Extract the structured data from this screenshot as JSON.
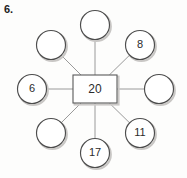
{
  "worksheet": {
    "question_number": "6."
  },
  "diagram": {
    "type": "number-web",
    "center": {
      "label": "20",
      "shape": "rectangle",
      "cx": 95,
      "cy": 89,
      "width": 44,
      "height": 28
    },
    "node_radius": 14.5,
    "spoke_color": "#9a9a9a",
    "node_stroke_color": "#4d4d4d",
    "center_stroke_color": "#5a5a5a",
    "background_color": "#fdfdfc",
    "nodes": [
      {
        "id": "node-top",
        "label": "",
        "cx": 95,
        "cy": 25,
        "position": "top"
      },
      {
        "id": "node-top-right",
        "label": "8",
        "cx": 140,
        "cy": 45,
        "position": "top-right"
      },
      {
        "id": "node-right",
        "label": "",
        "cx": 159,
        "cy": 89,
        "position": "right"
      },
      {
        "id": "node-bottom-right",
        "label": "11",
        "cx": 140,
        "cy": 133,
        "position": "bottom-right"
      },
      {
        "id": "node-bottom",
        "label": "17",
        "cx": 95,
        "cy": 153,
        "position": "bottom"
      },
      {
        "id": "node-bottom-left",
        "label": "",
        "cx": 51,
        "cy": 133,
        "position": "bottom-left"
      },
      {
        "id": "node-left",
        "label": "6",
        "cx": 32,
        "cy": 89,
        "position": "left"
      },
      {
        "id": "node-top-left",
        "label": "",
        "cx": 51,
        "cy": 45,
        "position": "top-left"
      }
    ]
  }
}
